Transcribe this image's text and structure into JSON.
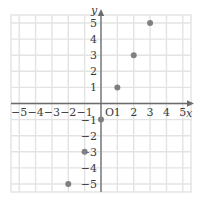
{
  "chart_data": {
    "type": "scatter",
    "title": "",
    "xlabel": "x",
    "ylabel": "y",
    "origin_label": "O",
    "grid": true,
    "legend": "none",
    "xlim": [
      -5.5,
      5.5
    ],
    "ylim": [
      -5.5,
      5.5
    ],
    "x_ticks": [
      -5,
      -4,
      -3,
      -2,
      -1,
      1,
      2,
      3,
      4,
      5
    ],
    "y_ticks": [
      -5,
      -4,
      -3,
      -2,
      -1,
      1,
      2,
      3,
      4,
      5
    ],
    "x_tick_labels": [
      "−5",
      "−4",
      "−3",
      "−2",
      "−1",
      "1",
      "2",
      "3",
      "4",
      "5"
    ],
    "y_tick_labels": [
      "−5",
      "−4",
      "−3",
      "−2",
      "−1",
      "1",
      "2",
      "3",
      "4",
      "5"
    ],
    "points": [
      {
        "x": -2,
        "y": -5
      },
      {
        "x": -1,
        "y": -3
      },
      {
        "x": 0,
        "y": -1
      },
      {
        "x": 1,
        "y": 1
      },
      {
        "x": 2,
        "y": 3
      },
      {
        "x": 3,
        "y": 5
      }
    ],
    "point_color": "#808080",
    "point_radius": 3,
    "grid_color": "#e3e3e3",
    "axis_color": "#6b6b6b",
    "background": "#ffffff"
  }
}
